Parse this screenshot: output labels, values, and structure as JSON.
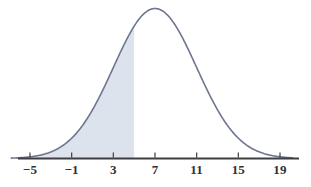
{
  "chart_data": {
    "type": "area",
    "title": "",
    "subtitle": "",
    "xlabel": "",
    "ylabel": "",
    "distribution": "normal",
    "mean": 7,
    "std_dev": 4,
    "xlim": [
      -7,
      21
    ],
    "ylim": [
      0,
      1.08
    ],
    "grid": false,
    "legend": null,
    "annotations": [],
    "axis": {
      "tick_values": [
        -5,
        -1,
        3,
        7,
        11,
        15,
        19
      ],
      "tick_labels": [
        "−5",
        "−1",
        "3",
        "7",
        "11",
        "15",
        "19"
      ],
      "tick_step": 4,
      "axis_start": -6.8,
      "axis_end": 20.2,
      "tick_direction": "up",
      "tick_length_px": 5
    },
    "shaded_region": {
      "label": "left tail shading",
      "from": -7,
      "to": 5,
      "fill_color": "#dce3ed",
      "boundary_value": 5
    },
    "curve": {
      "label": "normal density curve",
      "stroke_color": "#6d768f",
      "stroke_width": 1.6,
      "peak_x": 7,
      "peak_y": 1.0
    },
    "colors": {
      "curve": "#6d768f",
      "fill": "#dce3ed",
      "axis": "#3d3d42",
      "tick_text": "#2f2f34",
      "background": "#ffffff"
    }
  }
}
